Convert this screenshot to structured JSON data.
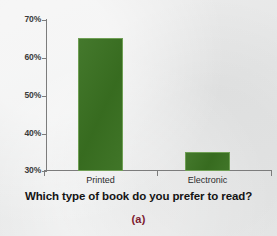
{
  "figure": {
    "caption": "(a)",
    "caption_color": "#7c2030",
    "background_color": "#e9eaea"
  },
  "chart_data": {
    "type": "bar",
    "title": "Which type of book do you prefer to read?",
    "xlabel": "",
    "ylabel": "",
    "categories": [
      "Printed",
      "Electronic"
    ],
    "values": [
      65,
      35
    ],
    "ylim": [
      30,
      70
    ],
    "yticks": [
      30,
      40,
      50,
      60,
      70
    ],
    "ytick_labels": [
      "30%",
      "40%",
      "50%",
      "60%",
      "70%"
    ],
    "grid": false,
    "legend": null,
    "bar_color": "#3a7121",
    "bar_edge_color": "#6f9f55",
    "axis_color": "#7c7c7c"
  }
}
